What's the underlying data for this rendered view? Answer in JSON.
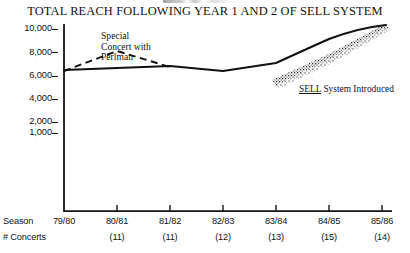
{
  "title": "TOTAL REACH FOLLOWING YEAR 1 AND 2 OF SELL SYSTEM",
  "header_remnant": "",
  "axis": {
    "row_label_season": "Season",
    "row_label_concerts": "# Concerts"
  },
  "annotations": {
    "perlman_line1": "Special",
    "perlman_line2": "Concert with",
    "perlman_line3": "Perlman",
    "sell_underlined": "SELL",
    "sell_rest": " System Introduced"
  },
  "chart_data": {
    "type": "line",
    "title": "TOTAL REACH FOLLOWING YEAR 1 AND 2 OF SELL SYSTEM",
    "xlabel": "Season",
    "ylabel": "",
    "grid": false,
    "legend": "none",
    "categories": [
      "79/80",
      "80/81",
      "81/82",
      "82/83",
      "83/84",
      "84/85",
      "85/86"
    ],
    "concerts": [
      "",
      "(11)",
      "(11)",
      "(12)",
      "(13)",
      "(15)",
      "(14)"
    ],
    "ytick_labels": [
      "10,000",
      "8,000",
      "6,000",
      "4,000",
      "2,000",
      "1,000"
    ],
    "ytick_values": [
      10000,
      8000,
      6000,
      4000,
      2000,
      1000
    ],
    "ylim": [
      0,
      10000
    ],
    "series": [
      {
        "name": "Total reach",
        "style": "solid",
        "values": [
          6700,
          6820,
          6950,
          6750,
          7100,
          8450,
          10000
        ]
      },
      {
        "name": "Special concert with Perlman",
        "style": "dashed",
        "x": [
          "79/80",
          "80/81",
          "81/82"
        ],
        "values": [
          6700,
          8000,
          6950
        ]
      }
    ],
    "shading": {
      "name": "growth-band",
      "style": "stippled",
      "from": "83/84",
      "to": "85/86"
    }
  }
}
